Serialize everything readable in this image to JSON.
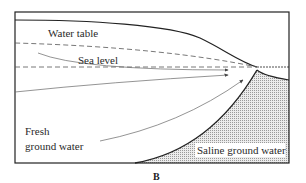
{
  "diagram": {
    "panel_label": "B",
    "labels": {
      "water_table": "Water table",
      "sea_level": "Sea level",
      "fresh_line1": "Fresh",
      "fresh_line2": "ground water",
      "saline": "Saline ground water"
    },
    "colors": {
      "line": "#222222",
      "flow": "#666666",
      "dashed": "#555555",
      "stipple": "#cfcfcf",
      "background": "#ffffff"
    }
  }
}
